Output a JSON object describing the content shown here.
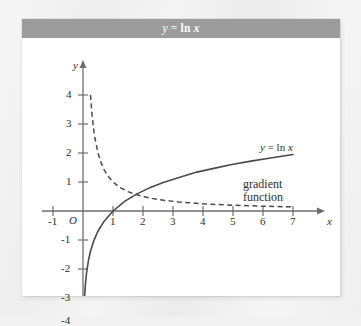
{
  "figure": {
    "title_html_parts": {
      "y": "y",
      "eq": " = ",
      "ln": "ln ",
      "x": "x"
    },
    "title_plain": "y = ln x",
    "background_color": "#ffffff",
    "title_bar_color": "#9c9c9c",
    "title_text_color": "#ffffff",
    "curve_color": "#4a4a4a",
    "axis_color": "#555555"
  },
  "axes": {
    "x_label": "x",
    "y_label": "y",
    "origin_label": "O",
    "x_ticks": [
      "-1",
      "1",
      "2",
      "3",
      "4",
      "5",
      "6",
      "7"
    ],
    "x_tick_values": [
      -1,
      1,
      2,
      3,
      4,
      5,
      6,
      7
    ],
    "y_ticks": [
      "4",
      "3",
      "2",
      "1",
      "-1",
      "-2",
      "-3",
      "-4"
    ],
    "y_tick_values": [
      4,
      3,
      2,
      1,
      -1,
      -2,
      -3,
      -4
    ],
    "xlim": [
      -1.4,
      7.9
    ],
    "ylim": [
      -4.35,
      4.6
    ]
  },
  "annotations": {
    "curve_label_y": "y",
    "curve_label_eq": " = ",
    "curve_label_ln": "ln ",
    "curve_label_x": "x",
    "curve_label_plain": "y = ln x",
    "gradient_label_line1": "gradient",
    "gradient_label_line2": "function"
  },
  "chart_data": {
    "type": "line",
    "title": "y = ln x",
    "xlabel": "x",
    "ylabel": "y",
    "xlim": [
      -1.4,
      7.9
    ],
    "ylim": [
      -4.35,
      4.6
    ],
    "grid": false,
    "legend": "inline-annotations",
    "xticks": [
      -1,
      1,
      2,
      3,
      4,
      5,
      6,
      7
    ],
    "yticks": [
      4,
      3,
      2,
      1,
      -1,
      -2,
      -3,
      -4
    ],
    "series": [
      {
        "name": "y = ln x",
        "style": "solid",
        "color": "#4a4a4a",
        "x": [
          0.0183,
          0.03,
          0.05,
          0.08,
          0.12,
          0.18,
          0.25,
          0.35,
          0.5,
          0.7,
          1.0,
          1.4,
          1.8,
          2.2,
          2.7,
          3.2,
          3.8,
          4.4,
          5.0,
          5.6,
          6.2,
          7.0
        ],
        "y": [
          -4.0,
          -3.51,
          -3.0,
          -2.53,
          -2.12,
          -1.71,
          -1.39,
          -1.05,
          -0.69,
          -0.36,
          0.0,
          0.34,
          0.59,
          0.79,
          0.99,
          1.16,
          1.34,
          1.48,
          1.61,
          1.72,
          1.82,
          1.95
        ]
      },
      {
        "name": "gradient function",
        "style": "dashed",
        "color": "#4a4a4a",
        "x": [
          0.25,
          0.3,
          0.35,
          0.4,
          0.5,
          0.6,
          0.7,
          0.8,
          1.0,
          1.2,
          1.5,
          1.8,
          2.2,
          2.7,
          3.2,
          4.0,
          5.0,
          6.0,
          7.0
        ],
        "y": [
          4.0,
          3.33,
          2.86,
          2.5,
          2.0,
          1.67,
          1.43,
          1.25,
          1.0,
          0.83,
          0.67,
          0.56,
          0.45,
          0.37,
          0.31,
          0.25,
          0.2,
          0.167,
          0.143
        ]
      }
    ],
    "annotations": [
      {
        "text": "y = ln x",
        "x": 5.9,
        "y": 2.35
      },
      {
        "text": "gradient function",
        "x": 5.3,
        "y": 0.95
      }
    ]
  }
}
